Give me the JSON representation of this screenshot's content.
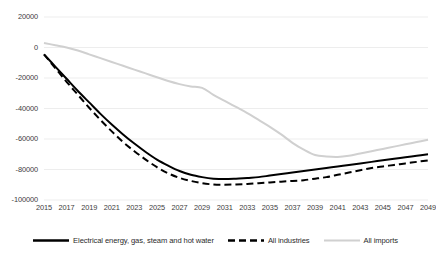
{
  "chart_data": {
    "type": "line",
    "title": "",
    "subtitle": "",
    "xlabel": "",
    "ylabel": "",
    "grid": true,
    "grid_axis": "y",
    "legend_position": "bottom",
    "xlim": [
      2015,
      2049
    ],
    "ylim": [
      -100000,
      20000
    ],
    "y_ticks": [
      20000,
      0,
      -20000,
      -40000,
      -60000,
      -80000,
      -100000
    ],
    "y_tick_labels": [
      "20000",
      "0",
      "-20000",
      "-40000",
      "-60000",
      "-80000",
      "-100000"
    ],
    "x_ticks": [
      2015,
      2017,
      2019,
      2021,
      2023,
      2025,
      2027,
      2029,
      2031,
      2033,
      2035,
      2037,
      2039,
      2041,
      2043,
      2045,
      2047,
      2049
    ],
    "x_tick_labels": [
      "2015",
      "2017",
      "2019",
      "2021",
      "2023",
      "2025",
      "2027",
      "2029",
      "2031",
      "2033",
      "2035",
      "2037",
      "2039",
      "2041",
      "2043",
      "2045",
      "2047",
      "2049"
    ],
    "x": [
      2015,
      2016,
      2017,
      2018,
      2019,
      2020,
      2021,
      2022,
      2023,
      2024,
      2025,
      2026,
      2027,
      2028,
      2029,
      2030,
      2031,
      2032,
      2033,
      2034,
      2035,
      2036,
      2037,
      2038,
      2039,
      2040,
      2041,
      2042,
      2043,
      2044,
      2045,
      2046,
      2047,
      2048,
      2049
    ],
    "series": [
      {
        "name": "Electrical energy, gas, steam and hot water",
        "style": "solid",
        "color": "#000000",
        "width": 2.0,
        "values": [
          -4500,
          -12500,
          -20500,
          -28500,
          -36000,
          -43500,
          -50500,
          -57000,
          -63000,
          -68500,
          -73500,
          -77500,
          -81000,
          -83500,
          -85000,
          -86000,
          -86300,
          -86000,
          -85500,
          -85000,
          -84000,
          -83000,
          -82000,
          -81000,
          -80000,
          -79000,
          -78000,
          -77000,
          -76000,
          -75000,
          -74000,
          -73000,
          -72000,
          -71000,
          -70000
        ]
      },
      {
        "name": "All industries",
        "style": "dashed",
        "color": "#000000",
        "width": 2.0,
        "values": [
          -4500,
          -13500,
          -22500,
          -31000,
          -39500,
          -47500,
          -55000,
          -62000,
          -68000,
          -73500,
          -78500,
          -82500,
          -85500,
          -87500,
          -89000,
          -89800,
          -90000,
          -89800,
          -89500,
          -89000,
          -88500,
          -88000,
          -87500,
          -87000,
          -86000,
          -85000,
          -83500,
          -82000,
          -80500,
          -79000,
          -78000,
          -77000,
          -76000,
          -75000,
          -74000
        ]
      },
      {
        "name": "All imports",
        "style": "solid",
        "color": "#d0d0d0",
        "width": 2.0,
        "values": [
          3000,
          1500,
          0,
          -2000,
          -4500,
          -7000,
          -9500,
          -12000,
          -14500,
          -17000,
          -19500,
          -22000,
          -24000,
          -25500,
          -26500,
          -31000,
          -35000,
          -39000,
          -43000,
          -47500,
          -52000,
          -57000,
          -62500,
          -67000,
          -70500,
          -71500,
          -71800,
          -71000,
          -69500,
          -68000,
          -66500,
          -65000,
          -63500,
          -62000,
          -60500
        ]
      }
    ]
  },
  "legend": {
    "items": [
      {
        "label": "Electrical energy, gas, steam and hot water",
        "icon": "solid-line-swatch"
      },
      {
        "label": "All industries",
        "icon": "dashed-line-swatch"
      },
      {
        "label": "All imports",
        "icon": "gray-line-swatch"
      }
    ]
  }
}
